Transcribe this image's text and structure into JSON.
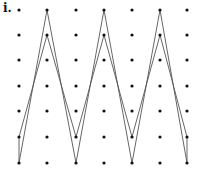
{
  "figure": {
    "label": "i.",
    "grid": {
      "cols_x": [
        19,
        47,
        76,
        104,
        132,
        160,
        187
      ],
      "rows_y": [
        10,
        35,
        60,
        86,
        111,
        137,
        163
      ],
      "dot_color": "#111111",
      "dot_radius": 1.6
    },
    "paths": [
      {
        "name": "outer-zigzag",
        "points": [
          [
            19,
            137
          ],
          [
            19,
            163
          ],
          [
            47,
            10
          ],
          [
            76,
            163
          ],
          [
            104,
            10
          ],
          [
            132,
            163
          ],
          [
            160,
            10
          ],
          [
            187,
            163
          ],
          [
            187,
            137
          ],
          [
            160,
            35
          ],
          [
            132,
            137
          ],
          [
            104,
            35
          ],
          [
            76,
            137
          ],
          [
            47,
            35
          ],
          [
            19,
            137
          ]
        ],
        "stroke": "#555555"
      }
    ]
  }
}
